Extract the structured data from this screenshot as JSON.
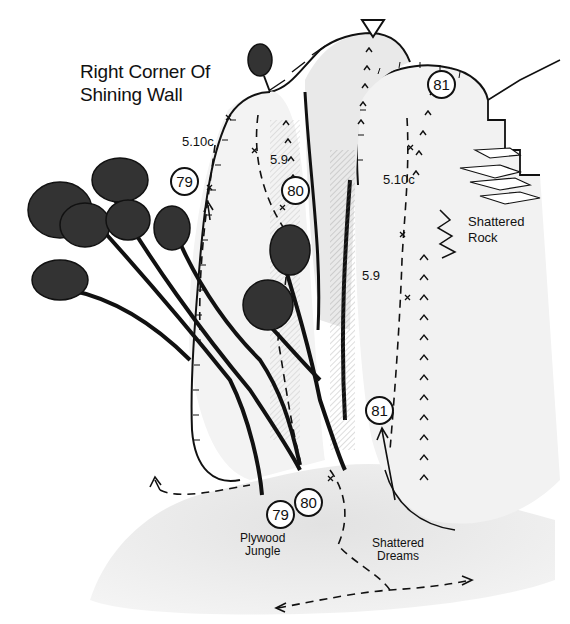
{
  "title": {
    "line1": "Right Corner Of",
    "line2": "Shining Wall"
  },
  "routes": [
    {
      "number": "79",
      "name_line1": "Plywood",
      "name_line2": "Jungle",
      "grade": "5.10c"
    },
    {
      "number": "80",
      "grade": "5.9"
    },
    {
      "number": "81",
      "name_line1": "Shattered",
      "name_line2": "Dreams",
      "grade": "5.9",
      "grade_upper": "5.10c"
    }
  ],
  "features": {
    "shattered_rock": {
      "line1": "Shattered",
      "line2": "Rock"
    }
  },
  "symbols": {
    "summit_marker": "triangle-down",
    "belay": "x",
    "crack": "caret-up"
  },
  "colors": {
    "ink": "#111111",
    "rock_shade": "#d9d9d9",
    "ground": "#e6e6e6",
    "background": "#ffffff"
  }
}
